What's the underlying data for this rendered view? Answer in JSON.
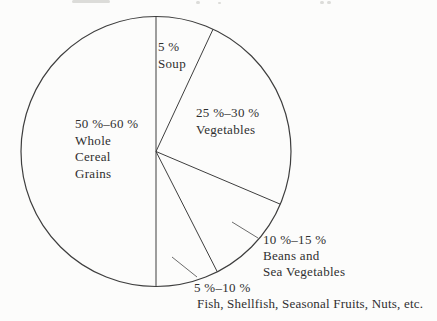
{
  "colors": {
    "ink": "#3e3e3e",
    "leader_ink": "#5a5a5a",
    "text": "#2f2f2f",
    "paper": "#fcfcfb"
  },
  "chart_data": {
    "type": "pie",
    "title": "",
    "legend": "none",
    "slices": [
      {
        "name": "soup",
        "value_label": "5 %",
        "percent_min": 5,
        "percent_max": 5,
        "label_lines": [
          "5 %",
          "Soup"
        ],
        "start_angle_deg": 0,
        "end_angle_deg": 25,
        "label_placement": "inside"
      },
      {
        "name": "vegetables",
        "value_label": "25 %–30 %",
        "percent_min": 25,
        "percent_max": 30,
        "label_lines": [
          "25 %–30 %",
          "Vegetables"
        ],
        "start_angle_deg": 25,
        "end_angle_deg": 113,
        "label_placement": "inside"
      },
      {
        "name": "beans-and-sea-vegetables",
        "value_label": "10 %–15 %",
        "percent_min": 10,
        "percent_max": 15,
        "label_lines": [
          "10 %–15 %",
          "Beans and",
          "Sea Vegetables"
        ],
        "start_angle_deg": 113,
        "end_angle_deg": 153,
        "label_placement": "outside-with-leader"
      },
      {
        "name": "fish-shellfish-seasonal-fruits-nuts-etc",
        "value_label": "5 %–10 %",
        "percent_min": 5,
        "percent_max": 10,
        "label_lines": [
          "5 %–10 %",
          "Fish, Shellfish, Seasonal Fruits, Nuts, etc."
        ],
        "start_angle_deg": 153,
        "end_angle_deg": 180,
        "label_placement": "outside-with-leader"
      },
      {
        "name": "whole-cereal-grains",
        "value_label": "50 %–60 %",
        "percent_min": 50,
        "percent_max": 60,
        "label_lines": [
          "50 %–60 %",
          "Whole",
          "Cereal",
          "Grains"
        ],
        "start_angle_deg": 180,
        "end_angle_deg": 360,
        "label_placement": "inside"
      }
    ]
  }
}
